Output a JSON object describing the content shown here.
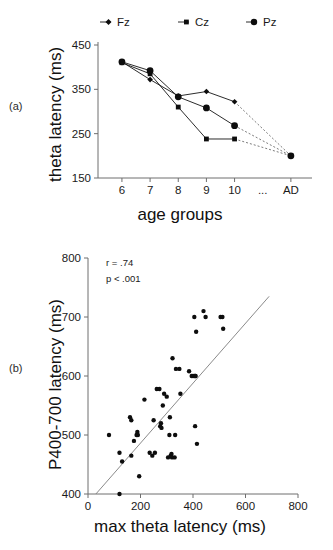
{
  "figure": {
    "panel_a_label": "(a)",
    "panel_b_label": "(b)"
  },
  "chart_data": [
    {
      "id": "panel-a",
      "type": "line",
      "title": "",
      "xlabel": "age groups",
      "ylabel": "theta latency (ms)",
      "categories": [
        "6",
        "7",
        "8",
        "9",
        "10",
        "...",
        "AD"
      ],
      "xtick_labels": [
        "6",
        "7",
        "8",
        "9",
        "10",
        "...",
        "AD"
      ],
      "ytick_labels": [
        "150",
        "250",
        "350",
        "450"
      ],
      "ylim": [
        150,
        450
      ],
      "grid": false,
      "legend_position": "top",
      "legend": [
        "Fz",
        "Cz",
        "Pz"
      ],
      "series": [
        {
          "name": "Fz",
          "marker": "diamond",
          "categories": [
            "6",
            "7",
            "8",
            "9",
            "10",
            "AD"
          ],
          "values": [
            412,
            372,
            335,
            345,
            322,
            200
          ],
          "dashed_segment": [
            "10",
            "AD"
          ]
        },
        {
          "name": "Cz",
          "marker": "square",
          "categories": [
            "6",
            "7",
            "8",
            "9",
            "10",
            "AD"
          ],
          "values": [
            410,
            385,
            310,
            238,
            238,
            200
          ],
          "dashed_segment": [
            "10",
            "AD"
          ]
        },
        {
          "name": "Pz",
          "marker": "circle",
          "categories": [
            "6",
            "7",
            "8",
            "9",
            "10",
            "AD"
          ],
          "values": [
            412,
            392,
            333,
            308,
            268,
            200
          ],
          "dashed_segment": [
            "10",
            "AD"
          ]
        }
      ]
    },
    {
      "id": "panel-b",
      "type": "scatter",
      "title": "",
      "xlabel": "max theta latency (ms)",
      "ylabel": "P400-700 latency (ms)",
      "xtick_labels": [
        "0",
        "200",
        "400",
        "600",
        "800"
      ],
      "ytick_labels": [
        "400",
        "500",
        "600",
        "700",
        "800"
      ],
      "xlim": [
        0,
        800
      ],
      "ylim": [
        400,
        800
      ],
      "grid": false,
      "annotations": [
        "r = .74",
        "p < .001"
      ],
      "correlation_r": ".74",
      "p_value": "p < .001",
      "fit_line": {
        "x": [
          30,
          690
        ],
        "y": [
          400,
          735
        ]
      },
      "points": [
        [
          80,
          500
        ],
        [
          120,
          400
        ],
        [
          120,
          470
        ],
        [
          130,
          455
        ],
        [
          160,
          530
        ],
        [
          165,
          525
        ],
        [
          165,
          465
        ],
        [
          175,
          490
        ],
        [
          185,
          500
        ],
        [
          188,
          505
        ],
        [
          190,
          500
        ],
        [
          195,
          430
        ],
        [
          215,
          560
        ],
        [
          235,
          470
        ],
        [
          245,
          465
        ],
        [
          250,
          525
        ],
        [
          255,
          470
        ],
        [
          262,
          578
        ],
        [
          272,
          578
        ],
        [
          275,
          515
        ],
        [
          278,
          520
        ],
        [
          280,
          512
        ],
        [
          285,
          550
        ],
        [
          290,
          570
        ],
        [
          300,
          565
        ],
        [
          305,
          462
        ],
        [
          310,
          500
        ],
        [
          312,
          530
        ],
        [
          315,
          465
        ],
        [
          318,
          468
        ],
        [
          320,
          462
        ],
        [
          322,
          630
        ],
        [
          330,
          462
        ],
        [
          332,
          500
        ],
        [
          335,
          612
        ],
        [
          348,
          612
        ],
        [
          352,
          570
        ],
        [
          385,
          608
        ],
        [
          395,
          600
        ],
        [
          400,
          600
        ],
        [
          405,
          600
        ],
        [
          408,
          600
        ],
        [
          410,
          600
        ],
        [
          405,
          700
        ],
        [
          408,
          515
        ],
        [
          412,
          675
        ],
        [
          415,
          485
        ],
        [
          440,
          710
        ],
        [
          448,
          700
        ],
        [
          505,
          700
        ],
        [
          512,
          700
        ],
        [
          515,
          680
        ]
      ]
    }
  ]
}
